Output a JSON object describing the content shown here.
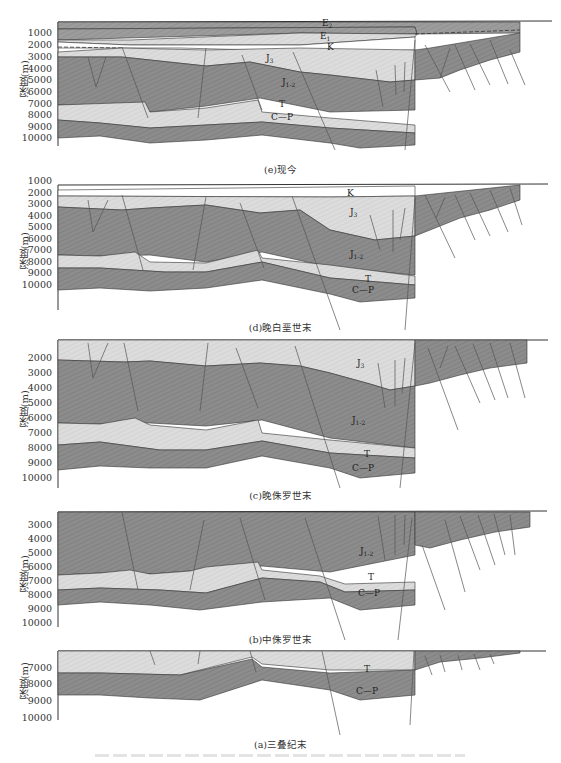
{
  "figure": {
    "y_axis_label": "深度(m)",
    "colors": {
      "dark_layer": "#8a8a8a",
      "light_layer": "#d9d9d9",
      "white_layer": "#ffffff",
      "outline": "#333333",
      "fault": "#555555"
    },
    "footnote": ""
  },
  "panels": [
    {
      "id": "e",
      "caption": "(e)现今",
      "ticks": [
        "1000",
        "2000",
        "3000",
        "4000",
        "5000",
        "6000",
        "7000",
        "8000",
        "9000",
        "10000"
      ],
      "labels": {
        "E2": "E",
        "E2_sub": "2",
        "E1": "E",
        "E1_sub": "1",
        "K": "K",
        "J3": "J",
        "J3_sub": "3",
        "J12": "J",
        "J12_sub": "1-2",
        "T": "T",
        "CP": "C—P"
      }
    },
    {
      "id": "d",
      "caption": "(d)晚白垩世末",
      "ticks": [
        "1000",
        "2000",
        "3000",
        "4000",
        "5000",
        "6000",
        "7000",
        "8000",
        "9000",
        "10000"
      ],
      "labels": {
        "K": "K",
        "J3": "J",
        "J3_sub": "3",
        "J12": "J",
        "J12_sub": "1-2",
        "T": "T",
        "CP": "C—P"
      }
    },
    {
      "id": "c",
      "caption": "(c)晚侏罗世末",
      "ticks": [
        "2000",
        "3000",
        "4000",
        "5000",
        "6000",
        "7000",
        "8000",
        "9000",
        "10000"
      ],
      "labels": {
        "J3": "J",
        "J3_sub": "3",
        "J12": "J",
        "J12_sub": "1-2",
        "T": "T",
        "CP": "C—P"
      }
    },
    {
      "id": "b",
      "caption": "(b)中侏罗世末",
      "ticks": [
        "3000",
        "4000",
        "5000",
        "6000",
        "7000",
        "8000",
        "9000",
        "10000"
      ],
      "labels": {
        "J12": "J",
        "J12_sub": "1-2",
        "T": "T",
        "CP": "C—P"
      }
    },
    {
      "id": "a",
      "caption": "(a)三叠纪末",
      "ticks": [
        "7000",
        "8000",
        "9000",
        "10000"
      ],
      "labels": {
        "T": "T",
        "CP": "C—P"
      }
    }
  ]
}
